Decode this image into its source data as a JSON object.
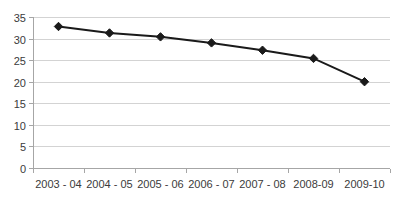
{
  "chart_data": {
    "type": "line",
    "title": "",
    "subtitle": "",
    "xlabel": "",
    "ylabel": "",
    "categories": [
      "2003 - 04",
      "2004 - 05",
      "2005 - 06",
      "2006 - 07",
      "2007 - 08",
      "2008-09",
      "2009-10"
    ],
    "values": [
      32.8,
      31.3,
      30.4,
      29.0,
      27.3,
      25.4,
      20.0
    ],
    "series": [
      {
        "name": "",
        "values": [
          32.8,
          31.3,
          30.4,
          29.0,
          27.3,
          25.4,
          20.0
        ]
      }
    ],
    "ylim": [
      0,
      35
    ],
    "ytick_labels": [
      "0",
      "5",
      "10",
      "15",
      "20",
      "25",
      "30",
      "35"
    ],
    "ytick_values": [
      0,
      5,
      10,
      15,
      20,
      25,
      30,
      35
    ],
    "grid": "horizontal",
    "legend": "none",
    "marker": "diamond",
    "colors": {
      "line": "#1a1a1a",
      "marker": "#1a1a1a",
      "gridline": "#d3d3d3",
      "axis": "#a6a6a6",
      "text": "#3b3b3b",
      "background": "#ffffff"
    }
  }
}
